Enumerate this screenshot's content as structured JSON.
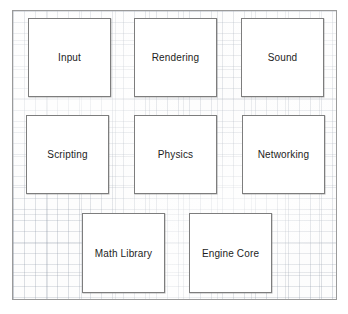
{
  "diagram": {
    "style": "graph-paper sketch",
    "frame": {
      "x": 12,
      "y": 10,
      "width": 325,
      "height": 290
    },
    "colors": {
      "page_background": "#ffffff",
      "paper_background": "#fdfdfd",
      "grid_line": "#8c96a5",
      "frame_border": "#9a9a9a",
      "node_border": "#7d7d7d",
      "node_fill": "#ffffff",
      "label_text": "#1d1d1d"
    },
    "rows": [
      {
        "row": 1,
        "count": 3
      },
      {
        "row": 2,
        "count": 3
      },
      {
        "row": 3,
        "count": 2
      }
    ],
    "nodes": [
      {
        "id": "input",
        "label": "Input",
        "row": 1,
        "col": 1,
        "x": 27,
        "y": 17,
        "width": 83,
        "height": 79
      },
      {
        "id": "rendering",
        "label": "Rendering",
        "row": 1,
        "col": 2,
        "x": 133,
        "y": 17,
        "width": 83,
        "height": 79
      },
      {
        "id": "sound",
        "label": "Sound",
        "row": 1,
        "col": 3,
        "x": 240,
        "y": 17,
        "width": 83,
        "height": 79
      },
      {
        "id": "scripting",
        "label": "Scripting",
        "row": 2,
        "col": 1,
        "x": 25,
        "y": 114,
        "width": 83,
        "height": 79
      },
      {
        "id": "physics",
        "label": "Physics",
        "row": 2,
        "col": 2,
        "x": 133,
        "y": 114,
        "width": 83,
        "height": 79
      },
      {
        "id": "networking",
        "label": "Networking",
        "row": 2,
        "col": 3,
        "x": 241,
        "y": 114,
        "width": 83,
        "height": 79
      },
      {
        "id": "math-library",
        "label": "Math Library",
        "row": 3,
        "col": 1,
        "x": 81,
        "y": 212,
        "width": 83,
        "height": 80
      },
      {
        "id": "engine-core",
        "label": "Engine Core",
        "row": 3,
        "col": 2,
        "x": 188,
        "y": 212,
        "width": 83,
        "height": 80
      }
    ]
  }
}
